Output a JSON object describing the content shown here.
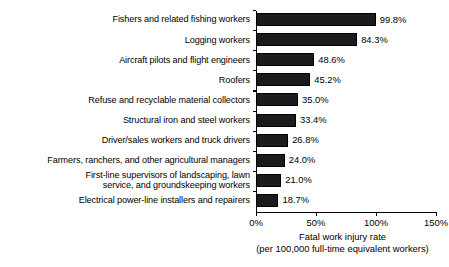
{
  "chart_data": {
    "type": "bar",
    "orientation": "horizontal",
    "title": "",
    "xlabel": "Fatal work injury rate",
    "xlabel_line2": "(per 100,000 full-time equivalent workers)",
    "ylabel": "",
    "xlim": [
      0,
      150
    ],
    "xticks": [
      0,
      50,
      100,
      150
    ],
    "xtick_labels": [
      "0%",
      "50%",
      "100%",
      "150%"
    ],
    "grid": false,
    "legend": false,
    "bar_color": "#1b1b1b",
    "categories": [
      "Fishers and related fishing workers",
      "Logging workers",
      "Aircraft pilots and flight engineers",
      "Roofers",
      "Refuse and recyclable material collectors",
      "Structural iron and steel workers",
      "Driver/sales workers and truck drivers",
      "Farmers, ranchers, and other agricultural managers",
      "First-line supervisors of landscaping, lawn\nservice, and groundskeeping workers",
      "Electrical power-line installers and repairers"
    ],
    "values": [
      99.8,
      84.3,
      48.6,
      45.2,
      35.0,
      33.4,
      26.8,
      24.0,
      21.0,
      18.7
    ],
    "data_labels": [
      "99.8%",
      "84.3%",
      "48.6%",
      "45.2%",
      "35.0%",
      "33.4%",
      "26.8%",
      "24.0%",
      "21.0%",
      "18.7%"
    ]
  }
}
